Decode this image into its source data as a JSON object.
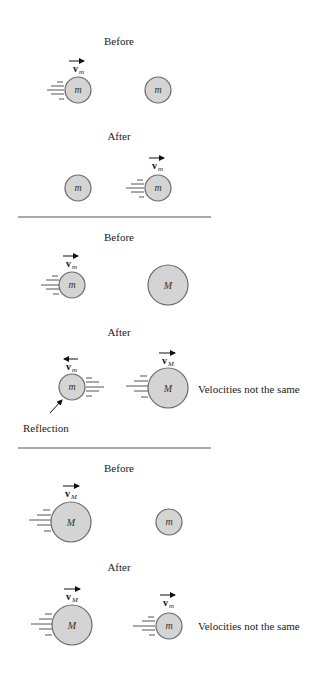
{
  "scenarios": [
    {
      "before": {
        "title": "Before",
        "balls": [
          {
            "label": "m",
            "size": "small",
            "moving": true,
            "velocity": {
              "symbol": "v",
              "sub": "m",
              "direction": "right"
            }
          },
          {
            "label": "m",
            "size": "small",
            "moving": false
          }
        ]
      },
      "after": {
        "title": "After",
        "balls": [
          {
            "label": "m",
            "size": "small",
            "moving": false
          },
          {
            "label": "m",
            "size": "small",
            "moving": true,
            "velocity": {
              "symbol": "v",
              "sub": "m",
              "direction": "right"
            }
          }
        ]
      }
    },
    {
      "before": {
        "title": "Before",
        "balls": [
          {
            "label": "m",
            "size": "small",
            "moving": true,
            "velocity": {
              "symbol": "v",
              "sub": "m",
              "direction": "right"
            }
          },
          {
            "label": "M",
            "size": "large",
            "moving": false
          }
        ]
      },
      "after": {
        "title": "After",
        "balls": [
          {
            "label": "m",
            "size": "small",
            "moving": true,
            "velocity": {
              "symbol": "v",
              "sub": "m",
              "direction": "left"
            }
          },
          {
            "label": "M",
            "size": "large",
            "moving": true,
            "velocity": {
              "symbol": "v",
              "sub": "M",
              "direction": "right"
            }
          }
        ],
        "note": "Velocities not the same",
        "annotation": "Reflection"
      }
    },
    {
      "before": {
        "title": "Before",
        "balls": [
          {
            "label": "M",
            "size": "large",
            "moving": true,
            "velocity": {
              "symbol": "v",
              "sub": "M",
              "direction": "right"
            }
          },
          {
            "label": "m",
            "size": "small",
            "moving": false
          }
        ]
      },
      "after": {
        "title": "After",
        "balls": [
          {
            "label": "M",
            "size": "large",
            "moving": true,
            "velocity": {
              "symbol": "v",
              "sub": "M",
              "direction": "right"
            }
          },
          {
            "label": "m",
            "size": "small",
            "moving": true,
            "velocity": {
              "symbol": "v",
              "sub": "m",
              "direction": "right"
            }
          }
        ],
        "note": "Velocities not the same"
      }
    }
  ],
  "colors": {
    "ball_fill": "#d4d4d4",
    "ball_stroke": "#6a6a6a",
    "line": "#555555"
  }
}
